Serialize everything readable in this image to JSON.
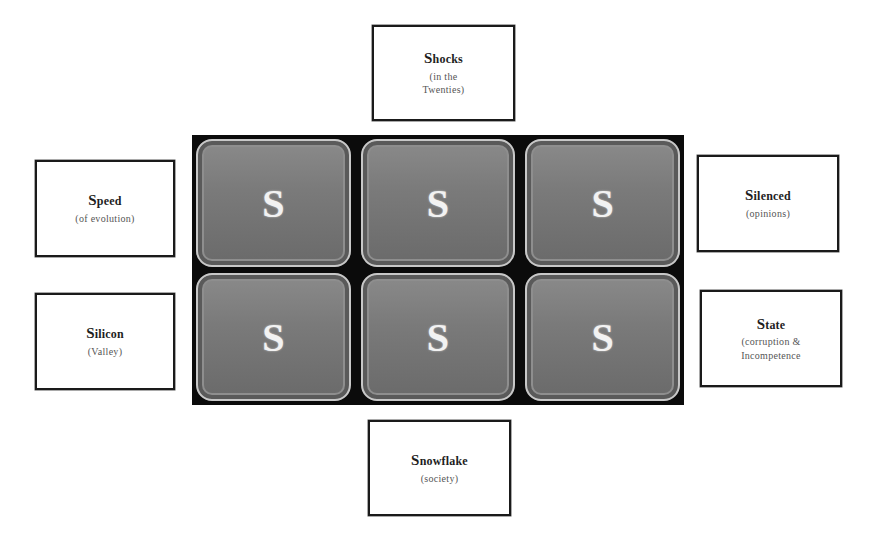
{
  "grid": {
    "tiles": [
      {
        "letter": "S"
      },
      {
        "letter": "S"
      },
      {
        "letter": "S"
      },
      {
        "letter": "S"
      },
      {
        "letter": "S"
      },
      {
        "letter": "S"
      }
    ]
  },
  "labels": {
    "top": {
      "initial": "S",
      "rest": "hocks",
      "sub1": "(in the",
      "sub2": "Twenties)"
    },
    "left_top": {
      "initial": "S",
      "rest": "peed",
      "sub1": "(of evolution)"
    },
    "left_bottom": {
      "initial": "S",
      "rest": "ilicon",
      "sub1": "(Valley)"
    },
    "right_top": {
      "initial": "S",
      "rest": "ilenced",
      "sub1": "(opinions)"
    },
    "right_bottom": {
      "initial": "S",
      "rest": "tate",
      "sub1": "(corruption &",
      "sub2": "Incompetence"
    },
    "bottom": {
      "initial": "S",
      "rest": "nowflake",
      "sub1": "(society)"
    }
  },
  "colors": {
    "grid_background": "#0b0b0b",
    "tile_fill": "#7a7a7a",
    "tile_border": "#c8c8c8",
    "letter": "#f2f2f2",
    "box_border": "#1a1a1a"
  }
}
